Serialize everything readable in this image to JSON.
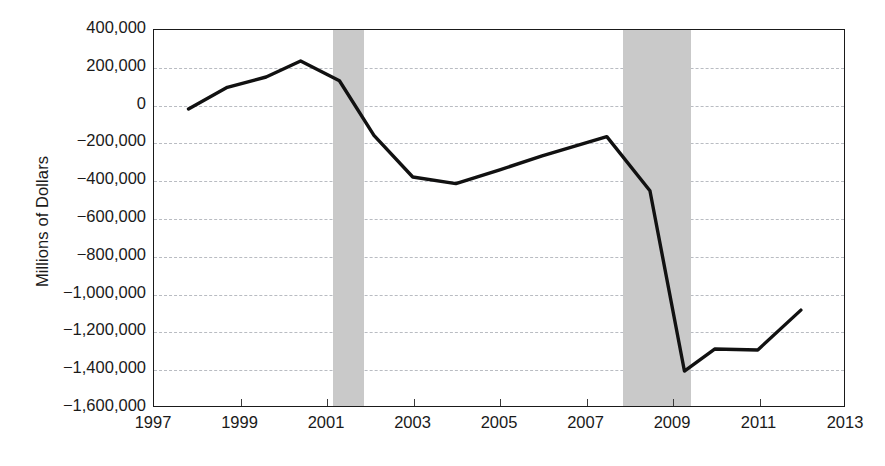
{
  "chart_data": {
    "type": "line",
    "title": "",
    "xlabel": "",
    "ylabel": "Millions of Dollars",
    "xlim": [
      1997,
      2013
    ],
    "ylim": [
      -1600000,
      400000
    ],
    "grid": true,
    "legend": "none",
    "y_ticks": [
      400000,
      200000,
      0,
      -200000,
      -400000,
      -600000,
      -800000,
      -1000000,
      -1200000,
      -1400000,
      -1600000
    ],
    "y_tick_labels": [
      "400,000",
      "200,000",
      "0",
      "−200,000",
      "−400,000",
      "−600,000",
      "−800,000",
      "−1,000,000",
      "−1,200,000",
      "−1,400,000",
      "−1,600,000"
    ],
    "x_ticks": [
      1997,
      1999,
      2001,
      2003,
      2005,
      2007,
      2009,
      2011,
      2013
    ],
    "x_tick_labels": [
      "1997",
      "1999",
      "2001",
      "2003",
      "2005",
      "2007",
      "2009",
      "2011",
      "2013"
    ],
    "series": [
      {
        "name": "Federal Surplus or Deficit",
        "color": "#111111",
        "line_width": 3.4,
        "x": [
          1997.8,
          1998.7,
          1999.6,
          2000.4,
          2001.3,
          2002.1,
          2003.0,
          2004.0,
          2005.0,
          2006.0,
          2007.5,
          2008.5,
          2009.3,
          2010.0,
          2011.0,
          2012.0
        ],
        "y": [
          -20000,
          95000,
          150000,
          235000,
          130000,
          -160000,
          -382000,
          -417000,
          -345000,
          -270000,
          -167000,
          -455000,
          -1414000,
          -1297000,
          -1302000,
          -1090000
        ]
      }
    ],
    "shaded_regions": [
      {
        "name": "recession-2001",
        "x0": 2001.15,
        "x1": 2001.85,
        "color": "#c9c9c9"
      },
      {
        "name": "recession-2008",
        "x0": 2007.85,
        "x1": 2009.42,
        "color": "#c9c9c9"
      }
    ]
  }
}
